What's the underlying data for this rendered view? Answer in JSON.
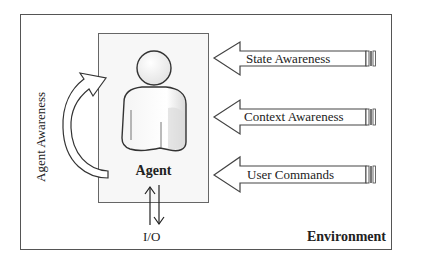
{
  "diagram": {
    "environment_label": "Environment",
    "agent_label": "Agent",
    "io_label": "I/O",
    "agent_awareness_label": "Agent Awareness",
    "inputs": [
      {
        "label": "State Awareness"
      },
      {
        "label": "Context Awareness"
      },
      {
        "label": "User Commands"
      }
    ],
    "colors": {
      "line": "#444444",
      "agent_box_fill": "#f7f7f7",
      "figure_fill": "#f2f2f2"
    }
  }
}
